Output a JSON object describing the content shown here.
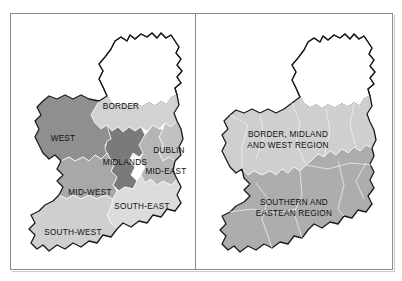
{
  "figure": {
    "panel_count": 2,
    "frame_color": "#8a8a8a",
    "background_color": "#ffffff"
  },
  "palette": {
    "outline": "#1a1a1a",
    "county_border": "#f2f2f2",
    "sea": "#ffffff",
    "northern_ireland": "#ffffff",
    "very_light_gray": "#e2e2e2",
    "light_gray": "#d2d2d2",
    "mid_light_gray": "#c2c2c2",
    "mid_gray": "#a8a8a8",
    "dark_gray": "#8f8f8f",
    "darker_gray": "#7a7a7a",
    "text": "#111111"
  },
  "left_panel": {
    "name": "eight-region-map",
    "labels": [
      {
        "id": "border",
        "text": "BORDER",
        "x": 110,
        "y": 96,
        "size": "lbl-rg",
        "anchor": "middle"
      },
      {
        "id": "west",
        "text": "WEST",
        "x": 52,
        "y": 128,
        "size": "lbl-rg",
        "anchor": "middle"
      },
      {
        "id": "dublin",
        "text": "DUBLIN",
        "x": 158,
        "y": 140,
        "size": "lbl-rg",
        "anchor": "middle"
      },
      {
        "id": "midlands",
        "text": "MIDLANDS",
        "x": 114,
        "y": 152,
        "size": "lbl-rg",
        "anchor": "middle"
      },
      {
        "id": "mid-east",
        "text": "MID-EAST",
        "x": 155,
        "y": 161,
        "size": "lbl-rg",
        "anchor": "middle"
      },
      {
        "id": "mid-west",
        "text": "MID-WEST",
        "x": 79,
        "y": 182,
        "size": "lbl-rg",
        "anchor": "middle"
      },
      {
        "id": "south-east",
        "text": "SOUTH-EAST",
        "x": 131,
        "y": 196,
        "size": "lbl-rg",
        "anchor": "middle"
      },
      {
        "id": "south-west",
        "text": "SOUTH-WEST",
        "x": 62,
        "y": 222,
        "size": "lbl-rg",
        "anchor": "middle"
      }
    ],
    "regions": [
      {
        "id": "border",
        "label": "BORDER",
        "fill": "#d2d2d2"
      },
      {
        "id": "west",
        "label": "WEST",
        "fill": "#8f8f8f"
      },
      {
        "id": "midlands",
        "label": "MIDLANDS",
        "fill": "#7a7a7a"
      },
      {
        "id": "dublin",
        "label": "DUBLIN",
        "fill": "#c2c2c2"
      },
      {
        "id": "mid-east",
        "label": "MID-EAST",
        "fill": "#b5b5b5"
      },
      {
        "id": "mid-west",
        "label": "MID-WEST",
        "fill": "#a8a8a8"
      },
      {
        "id": "south-east",
        "label": "SOUTH-EAST",
        "fill": "#dcdcdc"
      },
      {
        "id": "south-west",
        "label": "SOUTH-WEST",
        "fill": "#cfcfcf"
      },
      {
        "id": "northern-ireland",
        "label": "",
        "fill": "#ffffff"
      }
    ]
  },
  "right_panel": {
    "name": "two-region-map",
    "labels": [
      {
        "id": "bmw-line-1",
        "text": "BORDER, MIDLAND",
        "x": 92,
        "y": 124,
        "size": "lbl-rg",
        "anchor": "middle"
      },
      {
        "id": "bmw-line-2",
        "text": "AND WEST REGION",
        "x": 92,
        "y": 135,
        "size": "lbl-rg",
        "anchor": "middle"
      },
      {
        "id": "se-line-1",
        "text": "SOUTHERN AND",
        "x": 98,
        "y": 192,
        "size": "lbl-rg",
        "anchor": "middle"
      },
      {
        "id": "se-line-2",
        "text": "EASTEAN REGION",
        "x": 98,
        "y": 203,
        "size": "lbl-rg",
        "anchor": "middle"
      }
    ],
    "regions": [
      {
        "id": "bmw",
        "label": "BORDER, MIDLAND AND WEST REGION",
        "fill": "#cfcfcf"
      },
      {
        "id": "southern",
        "label": "SOUTHERN AND EASTEAN REGION",
        "fill": "#adadad"
      },
      {
        "id": "northern-ireland",
        "label": "",
        "fill": "#ffffff"
      }
    ]
  }
}
